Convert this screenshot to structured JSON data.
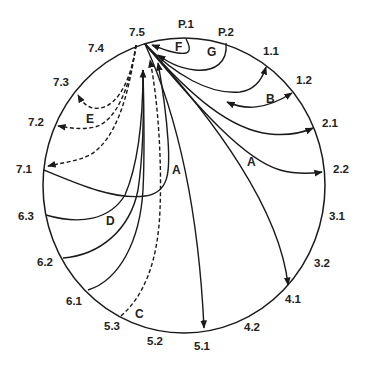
{
  "diagram": {
    "type": "circular chord diagram",
    "hub_position": "7.5",
    "colors": {
      "stroke": "#1a1a1a",
      "text": "#222222",
      "background": "#ffffff"
    },
    "positions": [
      {
        "id": "p1",
        "label": "P.1",
        "x": 178,
        "y": 28
      },
      {
        "id": "p2",
        "label": "P.2",
        "x": 218,
        "y": 36
      },
      {
        "id": "p11",
        "label": "1.1",
        "x": 263,
        "y": 55
      },
      {
        "id": "p12",
        "label": "1.2",
        "x": 296,
        "y": 84
      },
      {
        "id": "p21",
        "label": "2.1",
        "x": 322,
        "y": 127
      },
      {
        "id": "p22",
        "label": "2.2",
        "x": 333,
        "y": 173
      },
      {
        "id": "p31",
        "label": "3.1",
        "x": 329,
        "y": 220
      },
      {
        "id": "p32",
        "label": "3.2",
        "x": 314,
        "y": 267
      },
      {
        "id": "p41",
        "label": "4.1",
        "x": 285,
        "y": 303
      },
      {
        "id": "p42",
        "label": "4.2",
        "x": 244,
        "y": 331
      },
      {
        "id": "p51",
        "label": "5.1",
        "x": 194,
        "y": 350
      },
      {
        "id": "p52",
        "label": "5.2",
        "x": 147,
        "y": 345
      },
      {
        "id": "p53",
        "label": "5.3",
        "x": 104,
        "y": 330
      },
      {
        "id": "p61",
        "label": "6.1",
        "x": 66,
        "y": 305
      },
      {
        "id": "p62",
        "label": "6.2",
        "x": 37,
        "y": 266
      },
      {
        "id": "p63",
        "label": "6.3",
        "x": 18,
        "y": 220
      },
      {
        "id": "p71",
        "label": "7.1",
        "x": 16,
        "y": 173
      },
      {
        "id": "p72",
        "label": "7.2",
        "x": 28,
        "y": 126
      },
      {
        "id": "p73",
        "label": "7.3",
        "x": 53,
        "y": 86
      },
      {
        "id": "p74",
        "label": "7.4",
        "x": 88,
        "y": 52
      },
      {
        "id": "p75",
        "label": "7.5",
        "x": 129,
        "y": 36
      }
    ],
    "groups": [
      {
        "id": "A1",
        "label": "A",
        "x": 172,
        "y": 174,
        "style": "solid",
        "description": "arrows from 7.5 to 4.1 and 5.1; loop from 7.1"
      },
      {
        "id": "A2",
        "label": "A",
        "x": 247,
        "y": 166,
        "style": "solid",
        "description": "arrows from 7.5 to 2.1, 2.2, 4.1"
      },
      {
        "id": "B",
        "label": "B",
        "x": 266,
        "y": 103,
        "style": "solid",
        "description": "double-headed arrows toward 1.1 and 1.2"
      },
      {
        "id": "C",
        "label": "C",
        "x": 135,
        "y": 318,
        "style": "dashed",
        "description": "dashed arrow from 5.3 to 7.5"
      },
      {
        "id": "D",
        "label": "D",
        "x": 106,
        "y": 225,
        "style": "solid",
        "description": "arrows from 6.1, 6.2, 6.3 to 7.5"
      },
      {
        "id": "E",
        "label": "E",
        "x": 86,
        "y": 123,
        "style": "dashed",
        "description": "dashed arrows from 7.4 to 7.1, 7.2, 7.3"
      },
      {
        "id": "F",
        "label": "F",
        "x": 175,
        "y": 51,
        "style": "solid",
        "description": "arrow from P.1 to 7.5"
      },
      {
        "id": "G",
        "label": "G",
        "x": 207,
        "y": 56,
        "style": "solid",
        "description": "arrow from P.2 to 7.5"
      }
    ]
  }
}
